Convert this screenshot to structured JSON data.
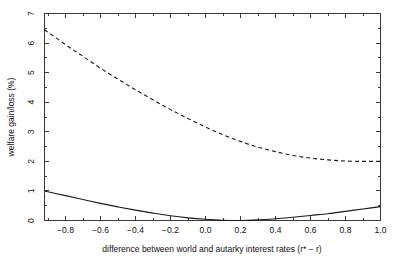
{
  "chart_data": {
    "type": "line",
    "title": "",
    "xlabel": "difference between world and autarky interest rates (r* − r)",
    "ylabel": "welfare gain/loss (%)",
    "xlim": [
      -0.92,
      1.0
    ],
    "ylim": [
      0,
      7
    ],
    "grid": false,
    "legend": "none",
    "xticks": [
      -0.8,
      -0.6,
      -0.4,
      -0.2,
      0.0,
      0.2,
      0.4,
      0.6,
      0.8,
      1.0
    ],
    "xtick_labels": [
      "-0.8",
      "-0.6",
      "-0.4",
      "-0.2",
      "0.0",
      "0.2",
      "0.4",
      "0.6",
      "0.8",
      "1.0"
    ],
    "yticks": [
      0,
      1,
      2,
      3,
      4,
      5,
      6,
      7
    ],
    "ytick_labels": [
      "0",
      "1",
      "2",
      "3",
      "4",
      "5",
      "6",
      "7"
    ],
    "minor_xticks": [
      -0.9,
      -0.7,
      -0.5,
      -0.3,
      -0.1,
      0.1,
      0.3,
      0.5,
      0.7,
      0.9
    ],
    "minor_yticks": [
      0.5,
      1.5,
      2.5,
      3.5,
      4.5,
      5.5,
      6.5
    ],
    "x": [
      -0.92,
      -0.8,
      -0.7,
      -0.6,
      -0.5,
      -0.4,
      -0.3,
      -0.2,
      -0.1,
      0.0,
      0.1,
      0.2,
      0.3,
      0.4,
      0.5,
      0.6,
      0.7,
      0.8,
      0.9,
      1.0
    ],
    "series": [
      {
        "name": "dashed-curve",
        "style": "dashed",
        "color": "#1a1a1a",
        "values": [
          6.45,
          5.95,
          5.55,
          5.15,
          4.78,
          4.42,
          4.08,
          3.75,
          3.45,
          3.16,
          2.9,
          2.67,
          2.48,
          2.33,
          2.2,
          2.11,
          2.05,
          2.01,
          2.0,
          2.0
        ]
      },
      {
        "name": "solid-curve",
        "style": "solid",
        "color": "#1a1a1a",
        "values": [
          1.0,
          0.84,
          0.71,
          0.58,
          0.46,
          0.35,
          0.25,
          0.16,
          0.09,
          0.04,
          0.01,
          0.0,
          0.02,
          0.06,
          0.11,
          0.17,
          0.23,
          0.31,
          0.39,
          0.47
        ]
      }
    ]
  },
  "figure": {
    "background": "#ffffff",
    "axis_color": "#3a3a3a",
    "line_color": "#1a1a1a"
  }
}
